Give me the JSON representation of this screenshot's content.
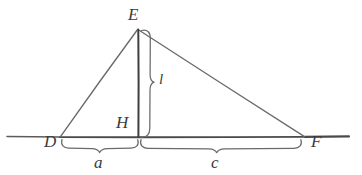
{
  "figure": {
    "background_color": "#ffffff",
    "stroke_color": "#4a4a4a",
    "baseline_color": "#3a3a3a",
    "text_color": "#3b3b3b",
    "vertices": [
      {
        "name": "D",
        "label": "D",
        "x": 60,
        "y": 137,
        "label_x": 44,
        "label_y": 139
      },
      {
        "name": "E",
        "label": "E",
        "x": 138,
        "y": 29,
        "label_x": 128,
        "label_y": 8
      },
      {
        "name": "F",
        "label": "F",
        "x": 305,
        "y": 137,
        "label_x": 310,
        "label_y": 135
      },
      {
        "name": "H",
        "label": "H",
        "x": 138,
        "y": 137,
        "label_x": 116,
        "label_y": 117
      }
    ],
    "segments": [
      {
        "name": "side-DE",
        "from": "D",
        "to": "E"
      },
      {
        "name": "side-EF",
        "from": "E",
        "to": "F"
      },
      {
        "name": "altitude-EH",
        "from": "E",
        "to": "H"
      },
      {
        "name": "baseline-DF",
        "from": "D",
        "to": "F"
      }
    ],
    "measure_labels": [
      {
        "name": "altitude-length",
        "label": "l",
        "x": 158,
        "y": 73
      },
      {
        "name": "segment-a-length",
        "label": "a",
        "x": 94,
        "y": 154
      },
      {
        "name": "segment-c-length",
        "label": "c",
        "x": 211,
        "y": 154
      }
    ],
    "braces": [
      {
        "name": "brace-altitude",
        "orientation": "vertical",
        "from": 29,
        "to": 137,
        "axis": 150,
        "label": "l"
      },
      {
        "name": "brace-a",
        "orientation": "horizontal",
        "from": 62,
        "to": 137,
        "axis": 145,
        "label": "a"
      },
      {
        "name": "brace-c",
        "orientation": "horizontal",
        "from": 141,
        "to": 301,
        "axis": 145,
        "label": "c"
      }
    ],
    "baseline": {
      "name": "extended-baseline",
      "x_start": 7,
      "x_end": 349,
      "y": 137
    }
  }
}
